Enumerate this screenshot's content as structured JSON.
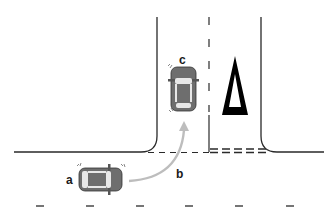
{
  "diagram": {
    "type": "road-intersection",
    "labels": {
      "a": "a",
      "b": "b",
      "c": "c"
    },
    "elements": {
      "vehicle_a": {
        "label": "a",
        "orientation": "facing-right",
        "color": "#6e6e6e"
      },
      "vehicle_c": {
        "label": "c",
        "orientation": "facing-up",
        "color": "#6e6e6e"
      },
      "path_b": {
        "label": "b",
        "description": "curved turn arrow from vehicle a into side road",
        "color": "#bdbdbd"
      },
      "yield_triangle": {
        "description": "give-way road marking triangle",
        "color": "#000000"
      }
    },
    "colors": {
      "road_line": "#2a2a2a",
      "vehicle": "#6e6e6e",
      "arrow": "#bdbdbd",
      "background": "#ffffff"
    }
  }
}
